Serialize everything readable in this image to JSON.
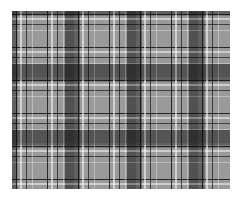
{
  "image": {
    "subject": "grayscale plaid / tartan fabric pattern",
    "colors": {
      "base": "#9a9a9a",
      "dark_band": "#3a3a3a",
      "light_line": "#e8e8e8",
      "dark_line": "#111111",
      "background": "#ffffff"
    },
    "pattern": {
      "vertical_dark_bands_x": [
        65,
        127,
        189
      ],
      "horizontal_dark_bands_y": [
        64,
        130
      ],
      "band_width_px": 15
    }
  }
}
